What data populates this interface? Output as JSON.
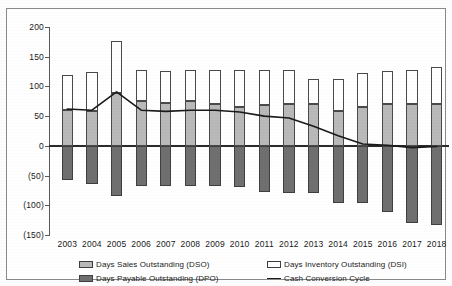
{
  "chart_data": {
    "type": "bar",
    "title": "",
    "subtitle": "",
    "xlabel": "",
    "ylabel": "",
    "ylim": [
      -150,
      200
    ],
    "yticks": [
      200,
      150,
      100,
      50,
      0,
      -50,
      -100,
      -150
    ],
    "ytick_labels": [
      "200",
      "150",
      "100",
      "50",
      "0",
      "(50)",
      "(100)",
      "(150)"
    ],
    "grid": false,
    "stacked": true,
    "legend_position": "bottom",
    "categories": [
      "2003",
      "2004",
      "2005",
      "2006",
      "2007",
      "2008",
      "2009",
      "2010",
      "2011",
      "2012",
      "2013",
      "2014",
      "2015",
      "2016",
      "2017",
      "2018"
    ],
    "series": [
      {
        "name": "Days Sales Outstanding (DSO)",
        "key": "dso",
        "color": "#b9b9b9",
        "values": [
          61,
          59,
          89,
          75,
          72,
          76,
          70,
          66,
          69,
          70,
          71,
          58,
          66,
          70,
          71,
          70
        ]
      },
      {
        "name": "Days Inventory Outstanding (DSI)",
        "key": "dsi",
        "color": "#ffffff",
        "values": [
          59,
          66,
          87,
          52,
          54,
          52,
          57,
          61,
          58,
          57,
          42,
          55,
          57,
          56,
          56,
          62
        ]
      },
      {
        "name": "Days Payable Outstanding (DPO)",
        "key": "dpo",
        "color": "#6f6f6f",
        "values": [
          -58,
          -65,
          -85,
          -67,
          -68,
          -68,
          -67,
          -70,
          -77,
          -80,
          -80,
          -96,
          -97,
          -112,
          -130,
          -133
        ]
      },
      {
        "name": "Cash Conversion Cycle",
        "key": "ccc",
        "type": "line",
        "color": "#1a1a1a",
        "values": [
          62,
          60,
          91,
          60,
          58,
          60,
          60,
          57,
          50,
          47,
          33,
          17,
          3,
          1,
          -3,
          -1
        ]
      }
    ],
    "legend": [
      {
        "label": "Days Sales Outstanding (DSO)",
        "marker": "swatch",
        "color": "#b9b9b9"
      },
      {
        "label": "Days Inventory Outstanding (DSI)",
        "marker": "swatch",
        "color": "#ffffff"
      },
      {
        "label": "Days Payable Outstanding (DPO)",
        "marker": "swatch",
        "color": "#6f6f6f"
      },
      {
        "label": "Cash Conversion Cycle",
        "marker": "line",
        "color": "#1a1a1a"
      }
    ]
  }
}
